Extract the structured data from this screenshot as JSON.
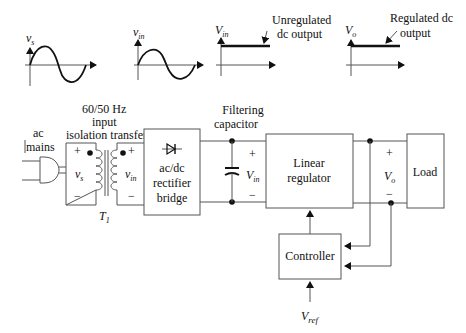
{
  "waveforms": {
    "vs": {
      "symbol": "v",
      "sub": "s",
      "shape": "sine"
    },
    "vin_ac": {
      "symbol": "v",
      "sub": "in",
      "shape": "sine"
    },
    "vin_dc": {
      "symbol": "V",
      "sub": "in",
      "shape": "dc",
      "annotation_line1": "Unregulated",
      "annotation_line2": "dc output"
    },
    "vo_dc": {
      "symbol": "V",
      "sub": "o",
      "shape": "dc",
      "annotation_line1": "Regulated dc",
      "annotation_line2": "output"
    }
  },
  "labels": {
    "transformer_title_1": "60/50 Hz",
    "transformer_title_2": "input",
    "transformer_title_3": "isolation transfer",
    "ac_mains_1": "ac",
    "ac_mains_2": "mains",
    "transformer_name": "T",
    "transformer_name_sub": "1",
    "filter_title_1": "Filtering",
    "filter_title_2": "capacitor",
    "plus": "+",
    "minus": "−"
  },
  "blocks": {
    "rectifier_1": "ac/dc",
    "rectifier_2": "rectifier",
    "rectifier_3": "bridge",
    "regulator_1": "Linear",
    "regulator_2": "regulator",
    "controller": "Controller",
    "load": "Load"
  },
  "nodes": {
    "vs": {
      "symbol": "v",
      "sub": "s"
    },
    "vin_ac": {
      "symbol": "v",
      "sub": "in"
    },
    "vin_dc": {
      "symbol": "V",
      "sub": "in"
    },
    "vo": {
      "symbol": "V",
      "sub": "o"
    },
    "vref": {
      "symbol": "V",
      "sub": "ref"
    }
  },
  "colors": {
    "line": "#555555",
    "ink": "#111111",
    "background": "#ffffff"
  }
}
